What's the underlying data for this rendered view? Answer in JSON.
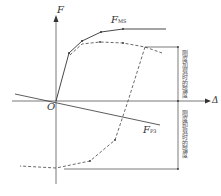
{
  "diagram": {
    "axis_y_label": "F",
    "axis_x_label": "Δ",
    "origin_label": "O",
    "curve_upper_label": "F",
    "curve_upper_sub": "MS",
    "line_lower_label": "F",
    "line_lower_sub": "P3",
    "annotation_upper": "刚度加载时的强度",
    "annotation_lower": "刚度卸载时的强度",
    "colors": {
      "line": "#333333",
      "dashed": "#444444"
    }
  }
}
